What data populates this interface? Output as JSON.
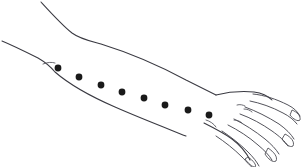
{
  "figure": {
    "view": "anterior forearm with hand extended to the right",
    "background_color": "#ffffff",
    "line_color": "#3a3a42",
    "marker_color": "#1a1a1a",
    "marker_label": "acupuncture-style point markers along forearm",
    "marker_count": 8,
    "marker_radius": 3.4
  },
  "markers": [
    {
      "id": "point-1",
      "cx": 58,
      "cy": 68,
      "label": "1"
    },
    {
      "id": "point-2",
      "cx": 79,
      "cy": 77,
      "label": "2"
    },
    {
      "id": "point-3",
      "cx": 101,
      "cy": 85,
      "label": "3"
    },
    {
      "id": "point-4",
      "cx": 122,
      "cy": 92,
      "label": "4"
    },
    {
      "id": "point-5",
      "cx": 144,
      "cy": 98,
      "label": "5"
    },
    {
      "id": "point-6",
      "cx": 165,
      "cy": 105,
      "label": "6"
    },
    {
      "id": "point-7",
      "cx": 188,
      "cy": 110,
      "label": "7"
    },
    {
      "id": "point-8",
      "cx": 209,
      "cy": 115,
      "label": "8"
    }
  ],
  "outlines": {
    "upper_edge": "M 41,2 C 52,14 62,25 72,33 C 80,39 90,41 101,44 C 130,53 160,66 186,80 C 198,86 208,91 216,95",
    "lower_edge": "M 2,41 C 14,46 26,52 38,58 C 45,62 50,66 55,72 C 70,85 92,97 115,107 C 140,118 166,128 186,136",
    "elbow_crease": "M 43,64 C 48,62 52,62 55,63",
    "wrist_upper": "M 216,95 C 226,93 238,92 248,93",
    "wrist_lower": "M 204,123 C 212,126 220,130 227,134",
    "hand_back": "M 216,95 C 228,92 242,91 254,92 C 262,93 268,96 272,100",
    "hand_lower_edge": "M 204,123 C 214,128 224,133 232,139 C 240,145 246,152 250,160",
    "thumb_web": "M 206,120 C 210,121 214,124 216,127"
  },
  "fingers": [
    {
      "id": "finger-index",
      "name": "index-finger",
      "top": "M 253,94 C 264,95 276,99 288,105 C 294,108 298,112 300,116",
      "bottom": "M 250,101 C 260,103 272,107 283,113 C 289,116 294,120 297,124",
      "nail": "M 292,110 C 297,112 301,116 300,120 C 298,122 293,119 290,115 Z"
    },
    {
      "id": "finger-middle",
      "name": "middle-finger",
      "top": "M 245,107 C 256,111 268,117 279,124 C 286,129 291,134 294,139",
      "bottom": "M 240,114 C 251,118 262,124 272,131 C 279,136 285,141 288,146",
      "nail": "M 285,134 C 291,137 295,142 293,146 C 290,148 285,144 282,139 Z"
    },
    {
      "id": "finger-ring",
      "name": "ring-finger",
      "top": "M 234,119 C 244,124 255,131 265,139 C 271,144 276,149 279,154",
      "bottom": "M 228,125 C 238,130 249,137 258,145 C 264,150 269,155 272,160",
      "nail": "M 268,148 C 274,152 278,157 276,161 C 273,163 268,159 265,154 Z"
    },
    {
      "id": "finger-little",
      "name": "little-finger",
      "top": "M 222,131 C 231,137 240,144 248,152 C 253,157 257,162 259,166",
      "bottom": "M 216,136 C 225,142 234,149 242,157 C 247,162 250,166 252,167",
      "nail": "M 248,157 C 254,161 257,166 255,167 C 252,167 248,163 245,159 Z"
    }
  ],
  "hand_details": {
    "knuckle_crease_1": "M 244,109 C 247,109 250,110 252,112",
    "knuckle_crease_2": "M 234,120 C 237,120 240,121 242,123",
    "palm_mark": "M 237,105 C 240,104 243,105 245,106"
  }
}
